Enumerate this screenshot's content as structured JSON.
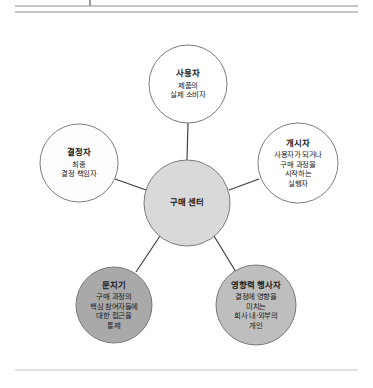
{
  "figure": {
    "background_color": "#ffffff",
    "rules": {
      "top_rule_1": "horizontal-rule",
      "top_rule_2": "horizontal-rule",
      "bottom_rule": "horizontal-rule",
      "tick": "vertical-tick-mark"
    }
  },
  "diagram": {
    "type": "hub-and-spoke",
    "center": {
      "id": "buying-center",
      "title": "구매 센터",
      "description_lines": [],
      "fill": "#d9d9d9",
      "stroke": "#6e6e6e"
    },
    "nodes": [
      {
        "id": "user",
        "title": "사용자",
        "description_lines": [
          "제품의",
          "실제 소비자"
        ],
        "fill": "#ffffff",
        "stroke": "#6e6e6e",
        "position": "top"
      },
      {
        "id": "decider",
        "title": "결정자",
        "description_lines": [
          "최종",
          "결정 책임자"
        ],
        "fill": "#fdfdfd",
        "stroke": "#6e6e6e",
        "position": "left"
      },
      {
        "id": "initiator",
        "title": "개시자",
        "description_lines": [
          "사용자가 되거나",
          "구매 과정을",
          "시작하는",
          "실행자"
        ],
        "fill": "#ffffff",
        "stroke": "#6e6e6e",
        "position": "right"
      },
      {
        "id": "gatekeeper",
        "title": "문지기",
        "description_lines": [
          "구매 과정의",
          "핵심 참여자들에",
          "대한 접근을",
          "통제"
        ],
        "fill": "#a9a9a9",
        "stroke": "#6e6e6e",
        "position": "bottom-left"
      },
      {
        "id": "influencer",
        "title": "영향력 행사자",
        "description_lines": [
          "결정에 영향을",
          "미치는",
          "회사 내·외부의",
          "개인"
        ],
        "fill": "#bebebe",
        "stroke": "#6e6e6e",
        "position": "bottom-right"
      }
    ]
  }
}
